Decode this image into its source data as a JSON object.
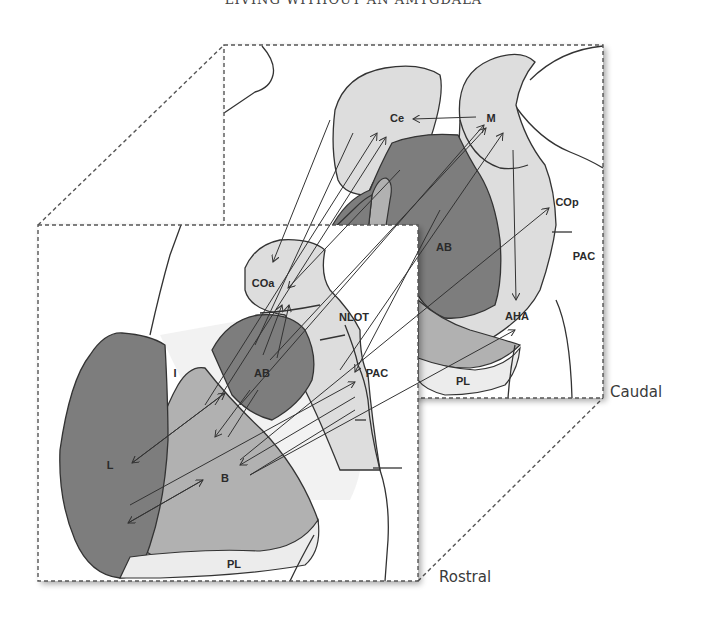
{
  "header": {
    "running_title": "LIVING WITHOUT AN AMYGDALA"
  },
  "colors": {
    "dark_region": "#7d7d7d",
    "mid_region": "#b1b1b1",
    "light_region": "#dddddd",
    "pale_region": "#ececec",
    "outline": "#333333",
    "background": "#ffffff"
  },
  "panels": {
    "caudal": {
      "orientation_label": "Caudal",
      "regions": {
        "ce": "Ce",
        "m": "M",
        "ab": "AB",
        "cop": "COp",
        "pac": "PAC",
        "aha": "AHA",
        "pl": "PL"
      }
    },
    "rostral": {
      "orientation_label": "Rostral",
      "regions": {
        "coa": "COa",
        "nlot": "NLOT",
        "i": "I",
        "ab": "AB",
        "pac": "PAC",
        "l": "L",
        "b": "B",
        "pl": "PL"
      }
    }
  },
  "connections": [
    {
      "from": "M",
      "to": "Ce"
    },
    {
      "from": "M",
      "to": "AHA"
    },
    {
      "from": "B",
      "to": "Ce"
    },
    {
      "from": "AB",
      "to": "Ce"
    },
    {
      "from": "AB",
      "to": "M"
    },
    {
      "from": "B",
      "to": "M"
    },
    {
      "from": "PAC",
      "to": "M"
    },
    {
      "from": "Ce",
      "to": "COa"
    },
    {
      "from": "M",
      "to": "COa"
    },
    {
      "from": "B",
      "to": "COa"
    },
    {
      "from": "AB",
      "to": "COa"
    },
    {
      "from": "M",
      "to": "PAC"
    },
    {
      "from": "L",
      "to": "PAC"
    },
    {
      "from": "PAC",
      "to": "B"
    },
    {
      "from": "B",
      "to": "AHA"
    },
    {
      "from": "B",
      "to": "COp"
    },
    {
      "from": "B",
      "to": "L"
    },
    {
      "from": "L",
      "to": "B"
    },
    {
      "from": "AB",
      "to": "B"
    }
  ]
}
